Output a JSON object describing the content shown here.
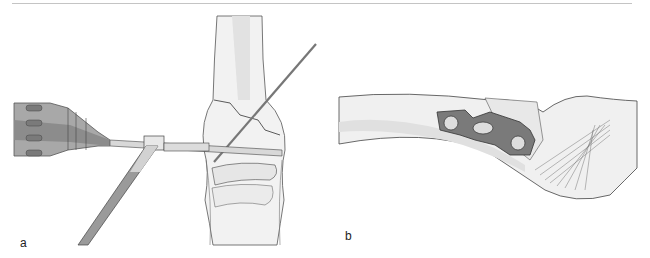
{
  "figure": {
    "panels": [
      {
        "label": "a",
        "description": "Power drill with drill bit passing through a drill guide sleeve into distal bone near joint, with a K-wire inserted obliquely across a fracture line"
      },
      {
        "label": "b",
        "description": "Lateral view of a bone with a small three-hole plate fixed across a fracture, with ligament/tendon fibers fanning out at the joint"
      }
    ],
    "colors": {
      "line": "#3a3a3a",
      "bone_fill": "#ececec",
      "bone_shade": "#dcdcdc",
      "instrument_dark": "#8a8a8a",
      "instrument_mid": "#b5b5b5",
      "plate": "#6e6e6e",
      "rule": "#c4c4c4"
    }
  }
}
